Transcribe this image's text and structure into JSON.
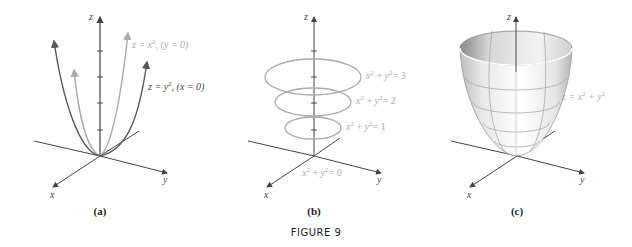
{
  "figure": {
    "caption": "FIGURE 9",
    "panels": [
      {
        "id": "a",
        "label": "(a)",
        "axes": {
          "x": "x",
          "y": "y",
          "z": "z"
        },
        "curves": [
          {
            "equation": "z = x², (y = 0)",
            "color": "#aaaaaa"
          },
          {
            "equation": "z = y², (x = 0)",
            "color": "#555555"
          }
        ]
      },
      {
        "id": "b",
        "label": "(b)",
        "axes": {
          "x": "x",
          "y": "y",
          "z": "z"
        },
        "level_curves": [
          {
            "equation": "x² + y² = 3"
          },
          {
            "equation": "x² + y² = 2"
          },
          {
            "equation": "x² + y² = 1"
          },
          {
            "equation": "x² + y² = 0"
          }
        ],
        "curve_color": "#aaaaaa"
      },
      {
        "id": "c",
        "label": "(c)",
        "axes": {
          "x": "x",
          "y": "y",
          "z": "z"
        },
        "surface": {
          "equation": "z = x² + y²",
          "label_color": "#b0b0b0"
        }
      }
    ]
  },
  "text": {
    "a_z": "z",
    "a_x": "x",
    "a_y": "y",
    "a_curve1_z": "z = x",
    "a_curve1_sup": "2",
    "a_curve1_cond": ",  (y = 0)",
    "a_curve2_z": "z = y",
    "a_curve2_sup": "2",
    "a_curve2_cond": ",  (x = 0)",
    "b_z": "z",
    "b_x": "x",
    "b_y": "y",
    "b_l3": "= 3",
    "b_l2": "= 2",
    "b_l1": "= 1",
    "b_l0": "= 0",
    "c_z": "z",
    "c_x": "x",
    "c_y": "y",
    "c_eq": "z = x",
    "c_eq2": " + y",
    "cap_a": "(a)",
    "cap_b": "(b)",
    "cap_c": "(c)",
    "figure": "FIGURE 9",
    "two": "2",
    "xv": "x",
    "yv": "y",
    "plus": " + "
  }
}
